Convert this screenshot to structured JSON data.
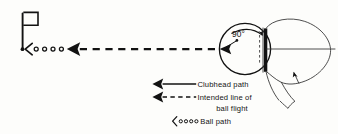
{
  "figure": {
    "kind": "golf-swing-path-diagram",
    "background_color": "#fdfdfb",
    "ink_color": "#121212"
  },
  "annotations": {
    "angle_label": "90°"
  },
  "legend": {
    "entries": [
      {
        "marker": "solid-arrow",
        "label": "Clubhead path"
      },
      {
        "marker": "dashed-arrow",
        "label": "Intended line of"
      },
      {
        "marker": "none",
        "label": "ball flight"
      },
      {
        "marker": "chevron-dots",
        "label": "Ball path"
      }
    ]
  },
  "elements": {
    "flagstick_name": "flagstick",
    "hole_name": "hole",
    "ball_name": "golf-ball",
    "clubface_name": "clubface",
    "clubhead_arc_name": "clubhead-path-arc",
    "ball_path_dots_count": 4
  }
}
